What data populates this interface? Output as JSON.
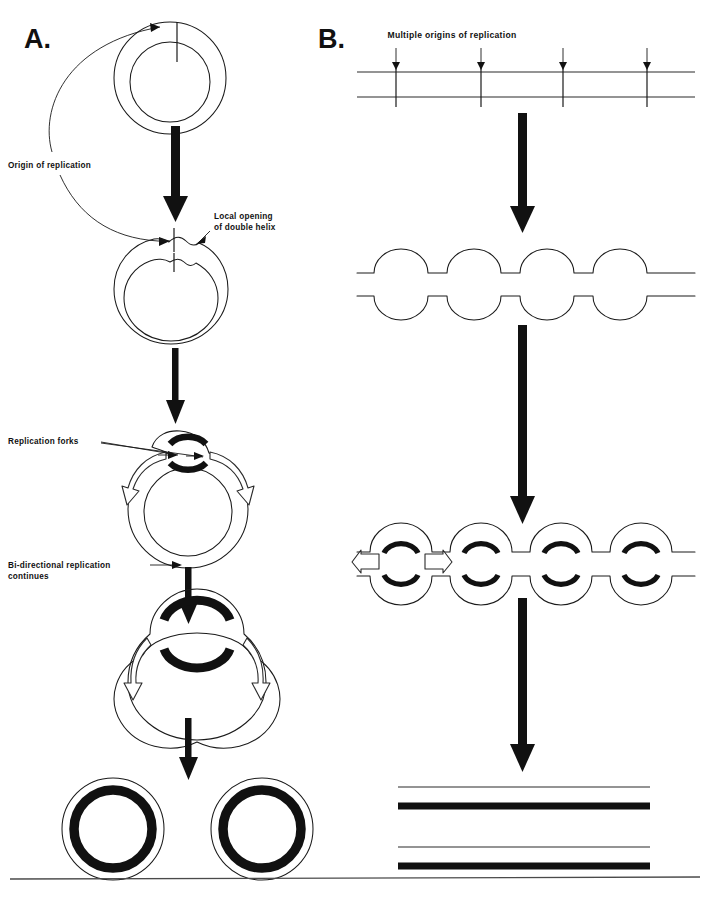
{
  "figure": {
    "domain_note": "Textbook diagram: DNA replication in circular and linear chromosomes",
    "background_color": "#ffffff",
    "ink_color": "#111111",
    "width": 710,
    "height": 900
  },
  "panel_a": {
    "letter": "A.",
    "labels": {
      "origin": "Origin of replication",
      "local_opening_line1": "Local opening",
      "local_opening_line2": "of double helix",
      "replication_forks": "Replication forks",
      "bidirectional_line1": "Bi-directional replication",
      "bidirectional_line2": "continues"
    },
    "stages": [
      "circular duplex DNA with single origin marked",
      "local opening of double helix at origin",
      "replication bubble with two replication forks moving apart",
      "bi-directional replication continues, larger bubble",
      "two completed daughter circular DNA molecules"
    ]
  },
  "panel_b": {
    "letter": "B.",
    "labels": {
      "multiple_origins": "Multiple origins of replication"
    },
    "origin_count": 4,
    "bubble_count": 4,
    "stages": [
      "linear duplex DNA with four origins of replication",
      "four replication bubbles open along the molecule",
      "bubbles enlarge; new strands synthesized bi-directionally",
      "two completed daughter linear DNA duplexes"
    ]
  },
  "legend": {
    "template_strand": "thin line = parental template strand",
    "new_strand": "thick black line = newly synthesized strand"
  }
}
